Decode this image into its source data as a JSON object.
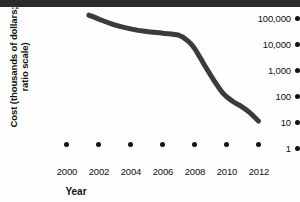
{
  "figure": {
    "axis_title_y_line1": "Cost (thousands of dollars;",
    "axis_title_y_line2": "ratio scale)",
    "axis_title_x": "Year"
  },
  "chart_data": {
    "type": "line",
    "title": "",
    "subtitle": "",
    "xlabel": "Year",
    "ylabel": "Cost (thousands of dollars; ratio scale)",
    "yscale": "log",
    "grid": false,
    "legend": null,
    "ytick_labels": [
      "100,000",
      "10,000",
      "1,000",
      "100",
      "10",
      "1"
    ],
    "ytick_values": [
      100000,
      10000,
      1000,
      100,
      10,
      1
    ],
    "ylim": [
      1,
      100000
    ],
    "xtick_labels": [
      "2000",
      "2002",
      "2004",
      "2006",
      "2008",
      "2010",
      "2012"
    ],
    "xtick_values": [
      2000,
      2002,
      2004,
      2006,
      2008,
      2010,
      2012
    ],
    "xlim": [
      2000,
      2012
    ],
    "series": [
      {
        "name": "Cost of sequencing a human genome",
        "x": [
          2001.4,
          2002.2,
          2003.0,
          2004.0,
          2005.0,
          2006.0,
          2007.0,
          2007.6,
          2008.0,
          2008.6,
          2009.2,
          2009.8,
          2010.4,
          2010.9,
          2011.4,
          2012.0
        ],
        "values": [
          95000,
          60000,
          40000,
          28000,
          22000,
          19000,
          16000,
          9500,
          5000,
          1200,
          300,
          90,
          45,
          30,
          18,
          8
        ]
      }
    ]
  }
}
